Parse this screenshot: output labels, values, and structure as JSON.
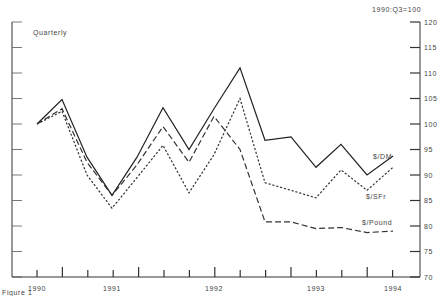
{
  "chart_data": {
    "type": "line",
    "title": "",
    "subtitle": "Quarterly",
    "index_note": "1990:Q3=100",
    "figure_label": "Figure 1",
    "xlabel": "",
    "ylabel": "",
    "ylim": [
      70,
      120
    ],
    "yticks": [
      70,
      75,
      80,
      85,
      90,
      95,
      100,
      105,
      110,
      115,
      120
    ],
    "ytick_labels": [
      "70",
      "75",
      "80",
      "85",
      "90",
      "95",
      "100",
      "105",
      "110",
      "115",
      "120"
    ],
    "xtick_labels": [
      "1990",
      "1991",
      "1992",
      "1993",
      "1994"
    ],
    "x": [
      "1990Q3",
      "1990Q4",
      "1991Q1",
      "1991Q2",
      "1991Q3",
      "1991Q4",
      "1992Q1",
      "1992Q2",
      "1992Q3",
      "1992Q4",
      "1993Q1",
      "1993Q2",
      "1993Q3",
      "1993Q4",
      "1994Q1"
    ],
    "grid": false,
    "legend_position": "inline-right",
    "series": [
      {
        "name": "$/DM",
        "style": "solid",
        "values": [
          100,
          104.8,
          93.5,
          86,
          93.5,
          103.2,
          95,
          103,
          111,
          96.8,
          97.5,
          91.5,
          96,
          90,
          93.7
        ]
      },
      {
        "name": "$/SFr",
        "style": "dotted",
        "values": [
          100,
          102.5,
          90,
          83.5,
          89.5,
          95.8,
          86.5,
          94,
          105,
          88.5,
          87,
          85.5,
          91,
          87,
          91.5
        ]
      },
      {
        "name": "$/Pound",
        "style": "dashed",
        "values": [
          100,
          103,
          92.5,
          86,
          92,
          99.5,
          92.5,
          101.5,
          95,
          80.8,
          80.8,
          79.5,
          79.7,
          78.7,
          79
        ]
      }
    ]
  },
  "labels": {
    "subtitle": "Quarterly",
    "index_note": "1990:Q3=100",
    "figure_label": "Figure 1",
    "series_dm": "$/DM",
    "series_sfr": "$/SFr",
    "series_pound": "$/Pound"
  }
}
